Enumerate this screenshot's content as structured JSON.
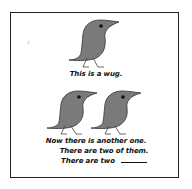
{
  "figure": {
    "wug_color": "#7a7a7a",
    "outline_color": "#333333",
    "border_color": "#222222",
    "caption_top": "This is a wug.",
    "caption_bottom": {
      "line1": "Now there is another one.",
      "line2": "There are two of them.",
      "line3": "There are two"
    }
  }
}
